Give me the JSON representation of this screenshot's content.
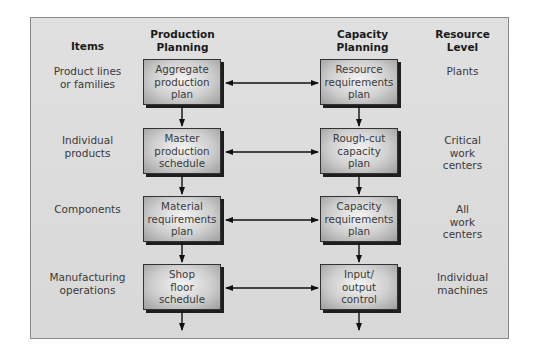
{
  "headers": {
    "items": "Items",
    "production": "Production\nPlanning",
    "capacity": "Capacity\nPlanning",
    "resource": "Resource\nLevel"
  },
  "rows": [
    {
      "item": "Product lines\nor families",
      "production": "Aggregate\nproduction\nplan",
      "capacity": "Resource\nrequirements\nplan",
      "resource": "Plants"
    },
    {
      "item": "Individual\nproducts",
      "production": "Master\nproduction\nschedule",
      "capacity": "Rough-cut\ncapacity\nplan",
      "resource": "Critical\nwork\ncenters"
    },
    {
      "item": "Components",
      "production": "Material\nrequirements\nplan",
      "capacity": "Capacity\nrequirements\nplan",
      "resource": "All\nwork\ncenters"
    },
    {
      "item": "Manufacturing\noperations",
      "production": "Shop\nfloor\nschedule",
      "capacity": "Input/\noutput\ncontrol",
      "resource": "Individual\nmachines"
    }
  ],
  "colors": {
    "panel": "#dcdcdc",
    "box_shadow": "#1e1e1e",
    "arrow": "#111111"
  }
}
